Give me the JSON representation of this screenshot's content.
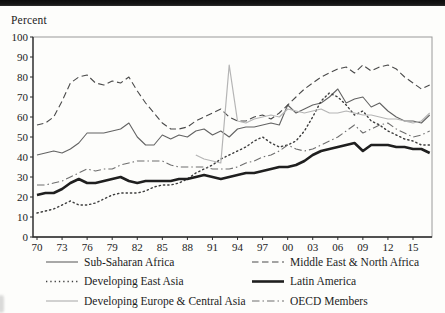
{
  "page": {
    "background": "#fdfdfb",
    "top_band_color": "#161616"
  },
  "chart_data": {
    "type": "line",
    "title": "",
    "ylabel": "Percent",
    "xlabel": "",
    "ylim": [
      0,
      100
    ],
    "ytick_step": 10,
    "yticks": [
      0,
      10,
      20,
      30,
      40,
      50,
      60,
      70,
      80,
      90,
      100
    ],
    "ytick_labels": [
      "0",
      "10",
      "20",
      "30",
      "40",
      "50",
      "60",
      "70",
      "80",
      "90",
      "100"
    ],
    "xtick_years": [
      1970,
      1973,
      1976,
      1979,
      1982,
      1985,
      1988,
      1991,
      1994,
      1997,
      2000,
      2003,
      2006,
      2009,
      2012,
      2015
    ],
    "xtick_labels": [
      "70",
      "73",
      "76",
      "79",
      "82",
      "85",
      "88",
      "91",
      "94",
      "97",
      "00",
      "03",
      "06",
      "09",
      "12",
      "15"
    ],
    "grid": false,
    "legend_position": "below-two-columns",
    "frame_color": "#9a9a9a",
    "axis_color": "#2a2a2a",
    "years": [
      1970,
      1971,
      1972,
      1973,
      1974,
      1975,
      1976,
      1977,
      1978,
      1979,
      1980,
      1981,
      1982,
      1983,
      1984,
      1985,
      1986,
      1987,
      1988,
      1989,
      1990,
      1991,
      1992,
      1993,
      1994,
      1995,
      1996,
      1997,
      1998,
      1999,
      2000,
      2001,
      2002,
      2003,
      2004,
      2005,
      2006,
      2007,
      2008,
      2009,
      2010,
      2011,
      2012,
      2013,
      2014,
      2015,
      2016,
      2017
    ],
    "series": [
      {
        "name": "Sub-Saharan Africa",
        "slug": "sub-saharan-africa",
        "line_style": "solid",
        "color": "#636363",
        "width": 1.1,
        "values": [
          41,
          42,
          43,
          42,
          44,
          47,
          52,
          52,
          52,
          53,
          54,
          57,
          50,
          46,
          46,
          51,
          49,
          51,
          50,
          53,
          54,
          51,
          53,
          50,
          54,
          55,
          55,
          56,
          57,
          56,
          66,
          62,
          64,
          66,
          67,
          70,
          74,
          67,
          69,
          70,
          65,
          67,
          63,
          60,
          58,
          58,
          57,
          61
        ]
      },
      {
        "name": "Middle East & North Africa",
        "slug": "middle-east-north-africa",
        "line_style": "dashed",
        "color": "#4a4a4a",
        "width": 1.1,
        "values": [
          56,
          57,
          60,
          68,
          77,
          80,
          81,
          77,
          76,
          78,
          77,
          80,
          73,
          67,
          62,
          57,
          54,
          54,
          55,
          58,
          60,
          62,
          64,
          60,
          58,
          58,
          60,
          61,
          59,
          62,
          66,
          70,
          74,
          77,
          80,
          82,
          84,
          85,
          82,
          86,
          83,
          85,
          86,
          84,
          80,
          77,
          74,
          76
        ]
      },
      {
        "name": "Developing East Asia",
        "slug": "developing-east-asia",
        "line_style": "dotted",
        "color": "#3d3d3d",
        "width": 1.4,
        "values": [
          12,
          13,
          14,
          16,
          18,
          16,
          16,
          17,
          19,
          21,
          22,
          22,
          22,
          23,
          25,
          26,
          26,
          27,
          29,
          32,
          34,
          36,
          39,
          41,
          43,
          45,
          48,
          50,
          47,
          45,
          46,
          48,
          53,
          60,
          68,
          72,
          70,
          66,
          61,
          63,
          58,
          56,
          53,
          51,
          49,
          48,
          46,
          46
        ]
      },
      {
        "name": "Latin America",
        "slug": "latin-america",
        "line_style": "solid-thick",
        "color": "#1f1f1f",
        "width": 2.6,
        "values": [
          21,
          22,
          22,
          24,
          27,
          29,
          27,
          27,
          28,
          29,
          30,
          28,
          27,
          28,
          28,
          28,
          28,
          29,
          29,
          30,
          31,
          30,
          29,
          30,
          31,
          32,
          32,
          33,
          34,
          35,
          35,
          36,
          38,
          41,
          43,
          44,
          45,
          46,
          47,
          43,
          46,
          46,
          46,
          45,
          45,
          44,
          44,
          42
        ]
      },
      {
        "name": "Developing Europe & Central Asia",
        "slug": "developing-europe-central-asia",
        "line_style": "solid-light",
        "color": "#b5b5b5",
        "width": 1.2,
        "values": [
          null,
          null,
          null,
          null,
          null,
          null,
          null,
          null,
          null,
          null,
          null,
          null,
          null,
          null,
          null,
          null,
          null,
          null,
          null,
          41,
          39,
          38,
          37,
          86,
          58,
          57,
          59,
          60,
          61,
          60,
          64,
          63,
          62,
          63,
          64,
          62,
          62,
          63,
          62,
          61,
          61,
          60,
          59,
          59,
          58,
          57,
          58,
          62
        ]
      },
      {
        "name": "OECD Members",
        "slug": "oecd-members",
        "line_style": "dashdot",
        "color": "#6e6e6e",
        "width": 1.1,
        "values": [
          26,
          26,
          27,
          28,
          30,
          32,
          34,
          33,
          34,
          34,
          36,
          37,
          38,
          38,
          38,
          38,
          36,
          35,
          35,
          35,
          35,
          34,
          34,
          34,
          35,
          37,
          38,
          40,
          41,
          43,
          46,
          44,
          43,
          44,
          46,
          48,
          50,
          53,
          56,
          52,
          54,
          56,
          57,
          54,
          52,
          50,
          51,
          53
        ]
      }
    ],
    "legend_columns": [
      [
        "Sub-Saharan Africa",
        "Developing East Asia",
        "Developing Europe & Central Asia"
      ],
      [
        "Middle East & North Africa",
        "Latin America",
        "OECD Members"
      ]
    ]
  }
}
